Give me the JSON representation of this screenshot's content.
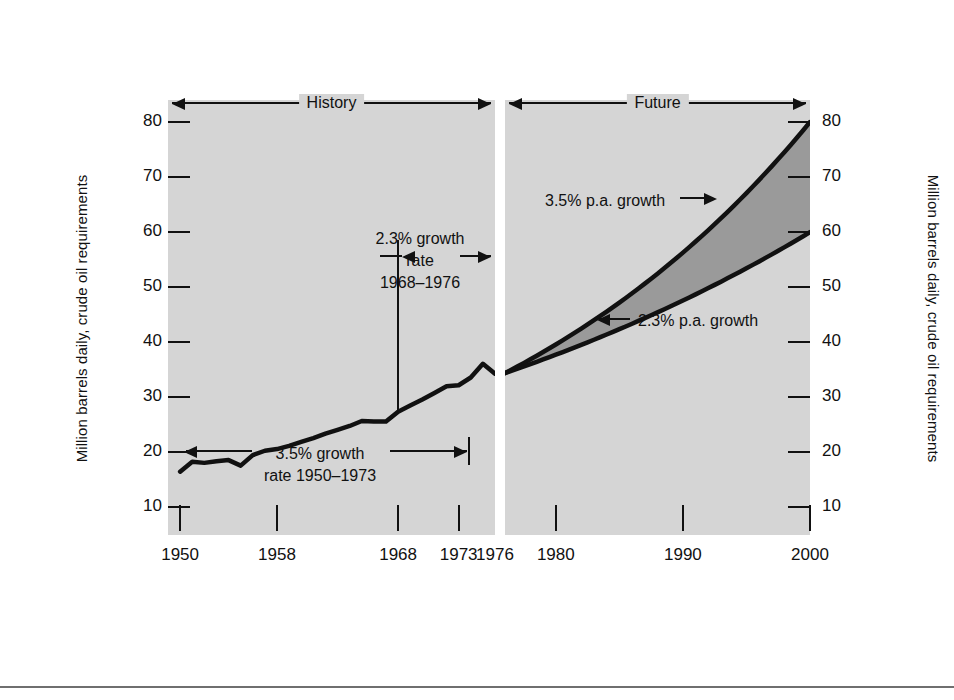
{
  "axis": {
    "y_title_left": "Million barrels daily, crude oil requirements",
    "y_title_right": "Million barrels daily, crude oil requirements",
    "y_ticks": [
      10,
      20,
      30,
      40,
      50,
      60,
      70,
      80
    ],
    "x_ticks_history": [
      1950,
      1958,
      1968,
      1973,
      1976
    ],
    "x_ticks_future": [
      1980,
      1990,
      2000
    ]
  },
  "panels": {
    "history_label": "History",
    "future_label": "Future"
  },
  "annotations": {
    "growth_1968_1976_line1": "2.3% growth",
    "growth_1968_1976_line2": "rate",
    "growth_1968_1976_line3": "1968–1976",
    "growth_1950_1973_line1": "3.5% growth",
    "growth_1950_1973_line2": "rate 1950–1973",
    "future_upper": "3.5% p.a. growth",
    "future_lower": "2.3% p.a. growth"
  },
  "colors": {
    "panel_background": "#d5d5d5",
    "band_fill": "#9a9a9a",
    "curve": "#111111",
    "page_background": "#ffffff",
    "rule": "#6f6f6f"
  },
  "chart_data": {
    "type": "line",
    "title": "",
    "xlabel": "",
    "ylabel": "Million barrels daily, crude oil requirements",
    "ylim": [
      5,
      84
    ],
    "grid": false,
    "legend": "none",
    "panels": [
      {
        "name": "History",
        "xlim": [
          1949,
          1976
        ],
        "series": [
          {
            "name": "Historical crude oil requirements",
            "x": [
              1950,
              1951,
              1952,
              1953,
              1954,
              1955,
              1956,
              1957,
              1958,
              1959,
              1960,
              1961,
              1962,
              1963,
              1964,
              1965,
              1966,
              1967,
              1968,
              1969,
              1970,
              1971,
              1972,
              1973,
              1974,
              1975,
              1976
            ],
            "values": [
              16.5,
              18.3,
              18.1,
              18.4,
              18.6,
              17.6,
              19.5,
              20.3,
              20.6,
              21.2,
              21.9,
              22.6,
              23.4,
              24.1,
              24.8,
              25.7,
              25.6,
              25.6,
              27.4,
              28.5,
              29.6,
              30.8,
              32.0,
              32.2,
              33.6,
              36.1,
              34.3
            ]
          }
        ]
      },
      {
        "name": "Future",
        "xlim": [
          1976,
          2000
        ],
        "series": [
          {
            "name": "3.5% p.a. growth",
            "x": [
              1976,
              1980,
              1985,
              1990,
              1995,
              2000
            ],
            "values": [
              34.4,
              39.5,
              46.9,
              55.7,
              66.2,
              80.0
            ]
          },
          {
            "name": "2.3% p.a. growth",
            "x": [
              1976,
              1980,
              1985,
              1990,
              1995,
              2000
            ],
            "values": [
              34.4,
              37.7,
              42.3,
              47.4,
              53.1,
              60.0
            ]
          }
        ],
        "band_between_series": true
      }
    ]
  }
}
